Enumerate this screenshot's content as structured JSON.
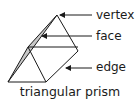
{
  "diagram": {
    "title": "triangular prism",
    "labels": {
      "vertex": "vertex",
      "face": "face",
      "edge": "edge"
    },
    "colors": {
      "stroke": "#1a1a1a",
      "shaded_face": "#c8c8c8",
      "background": "#ffffff"
    }
  }
}
